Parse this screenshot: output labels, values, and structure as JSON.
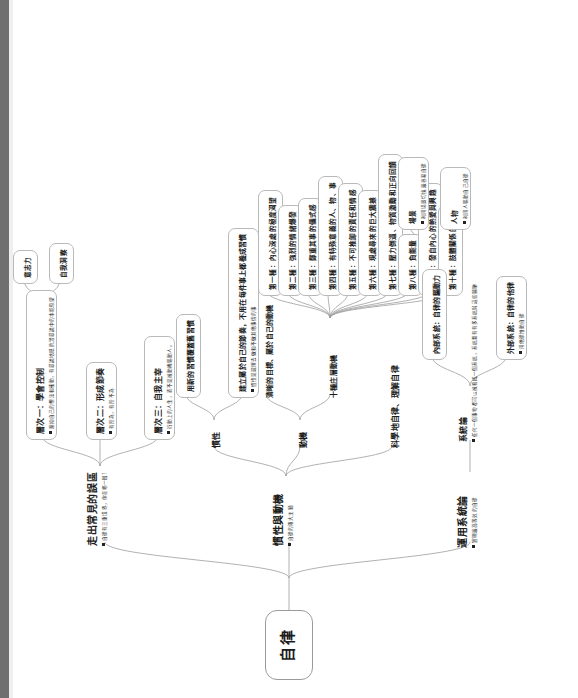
{
  "root": {
    "label": "自律"
  },
  "branches": [
    {
      "id": "branch-misconceptions",
      "label": "走出常見的誤區",
      "note": "自律有三重境界，你在哪一層？",
      "children": [
        {
          "id": "level-1",
          "label": "層次一：學會控制",
          "note": "壓抑自己的想法和衝動，有意識地抵抗潛意識中的本能慾望",
          "children": [
            {
              "id": "willpower",
              "label": "意志力",
              "note": ""
            },
            {
              "id": "self-insight",
              "label": "自我洞察",
              "note": ""
            }
          ]
        },
        {
          "id": "level-2",
          "label": "層次二：形成節奏",
          "note": "有所為，有所不為",
          "children": []
        },
        {
          "id": "level-3",
          "label": "層次三：自我主宰",
          "note": "行動上的人生，而不是被動機驅動人。",
          "children": []
        }
      ]
    },
    {
      "id": "branch-inertia-motivation",
      "label": "慣性與動機",
      "note": "自律的兩大主題",
      "children": [
        {
          "id": "inertia",
          "label": "慣性",
          "note": "",
          "children": [
            {
              "id": "inertia-new",
              "label": "用新的習慣覆蓋舊習慣",
              "note": "",
              "children": []
            },
            {
              "id": "inertia-rhythm",
              "label": "建立屬於自己的節奏，不用在每件事上都養成習慣",
              "note": "慣性是選擇去做和不做其他事情的事",
              "children": []
            }
          ]
        },
        {
          "id": "motivation",
          "label": "動機",
          "note": "",
          "children": [
            {
              "id": "motivation-goal",
              "label": "清晰的目標、屬於自己的動機",
              "note": "",
              "children": []
            },
            {
              "id": "motivation-ten",
              "label": "十種庄層動機",
              "note": "",
              "children": [
                {
                  "id": "m1",
                  "label": "第一種：內心深處的極度渴望"
                },
                {
                  "id": "m2",
                  "label": "第二種：強烈的情緒爆發"
                },
                {
                  "id": "m3",
                  "label": "第三種：鄭重其事的儀式感"
                },
                {
                  "id": "m4",
                  "label": "第四種：有特殊意義的人、物、事"
                },
                {
                  "id": "m5",
                  "label": "第五種：不可推卸的責任和情感"
                },
                {
                  "id": "m6",
                  "label": "第六種：現處尋來的巨大震撼"
                },
                {
                  "id": "m7",
                  "label": "第七種：壓力倒逼、物質激勵和正向回饋"
                },
                {
                  "id": "m8",
                  "label": "第八種：負能量"
                },
                {
                  "id": "m9",
                  "label": "第九種：發自內心的熱愛與興趣"
                },
                {
                  "id": "m10",
                  "label": "第十種：肢體關係的整合"
                }
              ]
            }
          ]
        },
        {
          "id": "self-discipline-science",
          "label": "科學地自律、理解自律",
          "note": "",
          "children": []
        }
      ]
    },
    {
      "id": "branch-systems",
      "label": "運用系統論",
      "note": "實現最高等效的自律",
      "children": [
        {
          "id": "systems-theory",
          "label": "系統論",
          "note": "任何一個事物都可以被看成一個系統，系統要有有多系統與這些關聯",
          "children": [
            {
              "id": "internal-system",
              "label": "內部系統：自律的驅動力",
              "note": "",
              "children": [
                {
                  "id": "scene",
                  "label": "場景",
                  "note": "利用場景切換最容易自律"
                },
                {
                  "id": "person",
                  "label": "人物",
                  "note": "利用人驅動自己自律"
                }
              ]
            },
            {
              "id": "external-system",
              "label": "外部系統：自律的他律",
              "note": "用他律推動自律",
              "children": []
            }
          ]
        }
      ]
    }
  ]
}
